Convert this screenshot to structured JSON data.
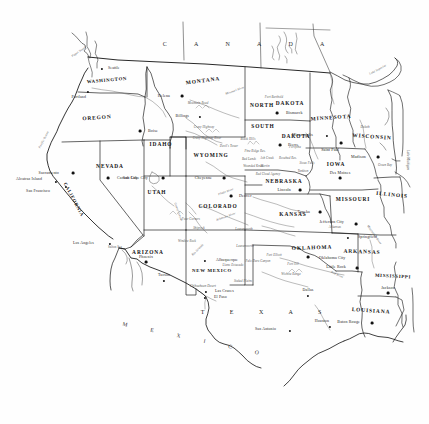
{
  "map": {
    "title": "Map of the Western and Central United States",
    "style": "line-art political map, black on white",
    "width": 429,
    "height": 424,
    "colors": {
      "outline": "#111111",
      "border": "#222222",
      "label": "#1a1a1a",
      "background": "#ffffff"
    }
  },
  "countries": [
    {
      "name": "C A N A D A",
      "x": 250,
      "y": 44
    },
    {
      "name": "M E X I C O",
      "x": 196,
      "y": 340
    }
  ],
  "regions": [
    {
      "name": "T E X A S",
      "x": 267,
      "y": 312
    }
  ],
  "oceans": [
    {
      "name": "Pacific Ocean",
      "x": 44,
      "y": 140
    }
  ],
  "lakes": [
    {
      "name": "Lake Superior",
      "x": 378,
      "y": 70
    },
    {
      "name": "Lake Michigan",
      "x": 407,
      "y": 160
    }
  ],
  "waters": [
    {
      "name": "Puget Sound",
      "x": 79,
      "y": 52
    },
    {
      "name": "Salton Sea",
      "x": 115,
      "y": 248
    }
  ],
  "states": [
    {
      "name": "WASHINGTON",
      "x": 107,
      "y": 81,
      "rot": "rot-wa"
    },
    {
      "name": "OREGON",
      "x": 97,
      "y": 118,
      "rot": "rot-or"
    },
    {
      "name": "IDAHO",
      "x": 161,
      "y": 145,
      "rot": ""
    },
    {
      "name": "MONTANA",
      "x": 203,
      "y": 81,
      "rot": "rot-mt"
    },
    {
      "name": "WYOMING",
      "x": 211,
      "y": 156,
      "rot": ""
    },
    {
      "name": "NEVADA",
      "x": 110,
      "y": 167,
      "rot": ""
    },
    {
      "name": "UTAH",
      "x": 157,
      "y": 193,
      "rot": ""
    },
    {
      "name": "COLORADO",
      "x": 218,
      "y": 207,
      "rot": ""
    },
    {
      "name": "ARIZONA",
      "x": 148,
      "y": 253,
      "rot": ""
    },
    {
      "name": "NEW MEXICO",
      "x": 212,
      "y": 271,
      "rot": ""
    },
    {
      "name": "NORTH",
      "x": 262,
      "y": 106,
      "rot": ""
    },
    {
      "name": "DAKOTA",
      "x": 290,
      "y": 104,
      "rot": ""
    },
    {
      "name": "SOUTH",
      "x": 263,
      "y": 127,
      "rot": ""
    },
    {
      "name": "DAKOTA",
      "x": 296,
      "y": 137,
      "rot": ""
    },
    {
      "name": "NEBRASKA",
      "x": 284,
      "y": 182,
      "rot": ""
    },
    {
      "name": "KANSAS",
      "x": 293,
      "y": 215,
      "rot": ""
    },
    {
      "name": "OKLAHOMA",
      "x": 312,
      "y": 248,
      "rot": "rot-ok"
    },
    {
      "name": "MINNESOTA",
      "x": 331,
      "y": 118,
      "rot": "rot-mn"
    },
    {
      "name": "IOWA",
      "x": 336,
      "y": 165,
      "rot": ""
    },
    {
      "name": "MISSOURI",
      "x": 353,
      "y": 200,
      "rot": ""
    },
    {
      "name": "WISCONSIN",
      "x": 372,
      "y": 137,
      "rot": "rot-wi"
    },
    {
      "name": "ILLINOIS",
      "x": 392,
      "y": 195,
      "rot": "rot-il"
    },
    {
      "name": "ARKANSAS",
      "x": 362,
      "y": 252,
      "rot": "rot-ar"
    },
    {
      "name": "MISSISSIPPI",
      "x": 393,
      "y": 277,
      "rot": "rot-ms"
    },
    {
      "name": "LOUISIANA",
      "x": 371,
      "y": 311,
      "rot": "rot-la"
    },
    {
      "name": "CALIFORNIA",
      "x": 73,
      "y": 200,
      "rot": "rot-ca"
    }
  ],
  "cities": [
    {
      "name": "Seattle",
      "x": 102,
      "y": 69,
      "dx": 6,
      "dy": 0,
      "capital": false
    },
    {
      "name": "Portland",
      "x": 88,
      "y": 92,
      "dx": -2,
      "dy": 6,
      "capital": false
    },
    {
      "name": "Boise",
      "x": 140,
      "y": 131,
      "dx": 8,
      "dy": 0,
      "capital": true
    },
    {
      "name": "Helena",
      "x": 182,
      "y": 96,
      "dx": -12,
      "dy": 0,
      "capital": true
    },
    {
      "name": "Billings",
      "x": 200,
      "y": 117,
      "dx": -11,
      "dy": 0,
      "capital": false
    },
    {
      "name": "Sacramento",
      "x": 73,
      "y": 173,
      "dx": -14,
      "dy": 0,
      "capital": true
    },
    {
      "name": "San Francisco",
      "x": 66,
      "y": 187,
      "dx": -16,
      "dy": 5,
      "capital": false
    },
    {
      "name": "Alcatraz Island",
      "x": 56,
      "y": 182,
      "dx": -14,
      "dy": -2,
      "capital": false
    },
    {
      "name": "Los Angeles",
      "x": 110,
      "y": 244,
      "dx": -16,
      "dy": 0,
      "capital": false
    },
    {
      "name": "Carson City",
      "x": 108,
      "y": 178,
      "dx": 9,
      "dy": 0,
      "capital": true
    },
    {
      "name": "Salt Lake City",
      "x": 163,
      "y": 178,
      "dx": -15,
      "dy": 0,
      "capital": true
    },
    {
      "name": "Phoenix",
      "x": 146,
      "y": 262,
      "dx": 0,
      "dy": -5,
      "capital": true
    },
    {
      "name": "Tucson",
      "x": 164,
      "y": 281,
      "dx": 0,
      "dy": -5,
      "capital": false
    },
    {
      "name": "Albuquerque",
      "x": 205,
      "y": 261,
      "dx": 11,
      "dy": 0,
      "capital": false
    },
    {
      "name": "Las Cruces",
      "x": 206,
      "y": 292,
      "dx": 9,
      "dy": 0,
      "capital": false
    },
    {
      "name": "El Paso",
      "x": 205,
      "y": 298,
      "dx": 9,
      "dy": 0,
      "capital": false
    },
    {
      "name": "Cheyenne",
      "x": 224,
      "y": 178,
      "dx": -12,
      "dy": 0,
      "capital": true
    },
    {
      "name": "Denver",
      "x": 231,
      "y": 196,
      "dx": 8,
      "dy": 0,
      "capital": true
    },
    {
      "name": "Bismarck",
      "x": 277,
      "y": 113,
      "dx": 9,
      "dy": 0,
      "capital": true
    },
    {
      "name": "Pierre",
      "x": 280,
      "y": 145,
      "dx": 8,
      "dy": 0,
      "capital": true
    },
    {
      "name": "Lincoln",
      "x": 300,
      "y": 190,
      "dx": -9,
      "dy": 0,
      "capital": true
    },
    {
      "name": "Topeka",
      "x": 320,
      "y": 212,
      "dx": -10,
      "dy": 0,
      "capital": true
    },
    {
      "name": "Minneapolis",
      "x": 327,
      "y": 136,
      "dx": -14,
      "dy": 0,
      "capital": false
    },
    {
      "name": "Saint Paul",
      "x": 341,
      "y": 143,
      "dx": -2,
      "dy": 7,
      "capital": true
    },
    {
      "name": "Des Moines",
      "x": 340,
      "y": 178,
      "dx": 0,
      "dy": -5,
      "capital": true
    },
    {
      "name": "Madison",
      "x": 378,
      "y": 157,
      "dx": -12,
      "dy": 0,
      "capital": true
    },
    {
      "name": "Jefferson City",
      "x": 356,
      "y": 224,
      "dx": -12,
      "dy": -2,
      "capital": true
    },
    {
      "name": "Springfield",
      "x": 348,
      "y": 238,
      "dx": 10,
      "dy": 0,
      "capital": false
    },
    {
      "name": "Oklahoma City",
      "x": 308,
      "y": 257,
      "dx": 11,
      "dy": 1,
      "capital": true
    },
    {
      "name": "Little Rock",
      "x": 357,
      "y": 268,
      "dx": -11,
      "dy": -1,
      "capital": true
    },
    {
      "name": "Jackson",
      "x": 388,
      "y": 293,
      "dx": 0,
      "dy": -5,
      "capital": true
    },
    {
      "name": "Baton Rouge",
      "x": 372,
      "y": 323,
      "dx": -12,
      "dy": -1,
      "capital": true
    },
    {
      "name": "Dallas",
      "x": 308,
      "y": 296,
      "dx": 0,
      "dy": -5,
      "capital": false
    },
    {
      "name": "Houston",
      "x": 330,
      "y": 327,
      "dx": -1,
      "dy": -5,
      "capital": false
    },
    {
      "name": "San Antonio",
      "x": 290,
      "y": 331,
      "dx": -14,
      "dy": -1,
      "capital": false
    }
  ],
  "features": [
    {
      "name": "Missouri River",
      "x": 235,
      "y": 91,
      "rot": "rot-r3"
    },
    {
      "name": "Fort Berthold",
      "x": 274,
      "y": 98,
      "rot": ""
    },
    {
      "name": "Mountain Road",
      "x": 198,
      "y": 104,
      "rot": ""
    },
    {
      "name": "Crazy Highway",
      "x": 204,
      "y": 128,
      "rot": ""
    },
    {
      "name": "Crazy Highway River",
      "x": 207,
      "y": 139,
      "rot": ""
    },
    {
      "name": "Devil's Tower",
      "x": 229,
      "y": 147,
      "rot": ""
    },
    {
      "name": "Black Hills",
      "x": 248,
      "y": 140,
      "rot": ""
    },
    {
      "name": "Pine Ridge Res.",
      "x": 255,
      "y": 152,
      "rot": ""
    },
    {
      "name": "Bad Lands",
      "x": 249,
      "y": 160,
      "rot": ""
    },
    {
      "name": "Wounded Knee",
      "x": 253,
      "y": 167,
      "rot": ""
    },
    {
      "name": "Rosebud Res.",
      "x": 288,
      "y": 159,
      "rot": ""
    },
    {
      "name": "Sioux Falls",
      "x": 307,
      "y": 164,
      "rot": ""
    },
    {
      "name": "Yankton",
      "x": 303,
      "y": 172,
      "rot": ""
    },
    {
      "name": "Ash Creek",
      "x": 267,
      "y": 159,
      "rot": ""
    },
    {
      "name": "Martin",
      "x": 265,
      "y": 167,
      "rot": ""
    },
    {
      "name": "Red Cloud Agency",
      "x": 268,
      "y": 175,
      "rot": ""
    },
    {
      "name": "Forsythe",
      "x": 295,
      "y": 148,
      "rot": ""
    },
    {
      "name": "Duluth",
      "x": 365,
      "y": 128,
      "rot": ""
    },
    {
      "name": "Green Bay",
      "x": 385,
      "y": 166,
      "rot": ""
    },
    {
      "name": "Leavenworth",
      "x": 244,
      "y": 230,
      "rot": ""
    },
    {
      "name": "Leavenworth",
      "x": 245,
      "y": 247,
      "rot": ""
    },
    {
      "name": "Palo Duro Canyon",
      "x": 258,
      "y": 262,
      "rot": ""
    },
    {
      "name": "Fort Elliott",
      "x": 274,
      "y": 256,
      "rot": ""
    },
    {
      "name": "Fort Sill",
      "x": 293,
      "y": 265,
      "rot": ""
    },
    {
      "name": "Wichita Range",
      "x": 291,
      "y": 275,
      "rot": ""
    },
    {
      "name": "Staked Plains",
      "x": 243,
      "y": 282,
      "rot": ""
    },
    {
      "name": "Llano Estacado",
      "x": 233,
      "y": 266,
      "rot": ""
    },
    {
      "name": "Red River",
      "x": 337,
      "y": 275,
      "rot": "rot-r4"
    },
    {
      "name": "Four Corners",
      "x": 191,
      "y": 220,
      "rot": ""
    },
    {
      "name": "Shiprock",
      "x": 199,
      "y": 229,
      "rot": ""
    },
    {
      "name": "Window Rock",
      "x": 187,
      "y": 242,
      "rot": ""
    },
    {
      "name": "Grand Canyon",
      "x": 178,
      "y": 212,
      "rot": "rot-r5"
    },
    {
      "name": "Chihuahuan Desert",
      "x": 203,
      "y": 287,
      "rot": ""
    },
    {
      "name": "Rio Grande",
      "x": 198,
      "y": 250,
      "rot": "rot-r1"
    },
    {
      "name": "Arkansas River",
      "x": 226,
      "y": 217,
      "rot": "rot-r3"
    },
    {
      "name": "Platte River",
      "x": 226,
      "y": 192,
      "rot": "rot-r3"
    },
    {
      "name": "Mississippi River",
      "x": 374,
      "y": 235,
      "rot": "rot-r2"
    },
    {
      "name": "Arkansas",
      "x": 335,
      "y": 228,
      "rot": ""
    }
  ]
}
